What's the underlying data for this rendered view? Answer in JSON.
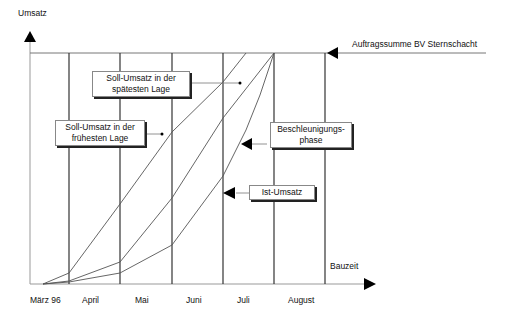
{
  "axes": {
    "y_label": "Umsatz",
    "x_label": "Bauzeit"
  },
  "months": [
    "März 96",
    "April",
    "Mai",
    "Juni",
    "Juli",
    "August"
  ],
  "reference_line_label": "Auftragssumme BV Sternschacht",
  "annotations": {
    "spaet": [
      "Soll-Umsatz in der",
      "spätesten Lage"
    ],
    "frueh": [
      "Soll-Umsatz in der",
      "frühesten Lage"
    ],
    "beschl": [
      "Beschleunigungs-",
      "phase"
    ],
    "ist": "Ist-Umsatz"
  },
  "colors": {
    "line": "#222222",
    "grid": "#333333",
    "curve": "#555555"
  }
}
